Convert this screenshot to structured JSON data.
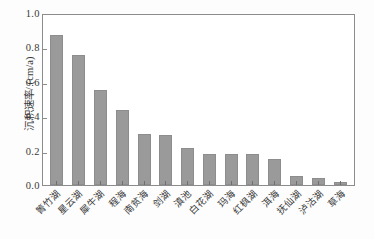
{
  "chart_data": {
    "type": "bar",
    "title": "",
    "xlabel": "",
    "ylabel": "沉积速率/ (cm/a)",
    "ylim": [
      0.0,
      1.0
    ],
    "yticks": [
      "1.0",
      "0.8",
      "0.6",
      "0.4",
      "0.2",
      "0.0"
    ],
    "ytick_values": [
      1.0,
      0.8,
      0.6,
      0.4,
      0.2,
      0.0
    ],
    "grid": false,
    "legend": null,
    "bar_color": "#9a9a9a",
    "axis_color": "#8c8c8c",
    "categories": [
      "箐竹湖",
      "星云湖",
      "犀牛湖",
      "程海",
      "南贫海",
      "剑湖",
      "滇池",
      "白花湖",
      "玛海",
      "红枫湖",
      "洱海",
      "抚仙湖",
      "泸沽湖",
      "草海"
    ],
    "values": [
      0.87,
      0.755,
      0.555,
      0.435,
      0.295,
      0.29,
      0.215,
      0.18,
      0.18,
      0.18,
      0.15,
      0.055,
      0.04,
      0.02
    ]
  }
}
